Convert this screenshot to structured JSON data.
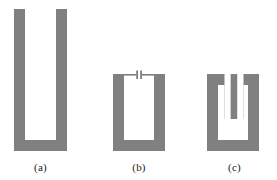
{
  "figure": {
    "background_color": "#ffffff",
    "shape_color": "#808080",
    "caption_color": "#1a1a1a",
    "panel_count": 3
  },
  "panels": [
    {
      "id": "a",
      "caption": "(a)",
      "name": "open-u-resonator-tall",
      "description": "tall open U-shaped split ring with long parallel arms",
      "geometry": {
        "x": 14,
        "y": 9,
        "width": 53,
        "height": 142,
        "stroke_width": 11,
        "gap_top": true
      }
    },
    {
      "id": "b",
      "caption": "(b)",
      "name": "u-resonator-with-capacitive-gap",
      "description": "U-shaped split ring closed at top by a thin bar with a central capacitive gap",
      "geometry": {
        "x": 113,
        "y": 74,
        "width": 52,
        "height": 77,
        "stroke_width": 11,
        "top_bar_thickness": 2,
        "gap_width": 3,
        "gap_marks": 2
      }
    },
    {
      "id": "c",
      "caption": "(c)",
      "name": "u-resonator-with-inner-tongue",
      "description": "U-shaped split ring with a narrow vertical slit cut from the top forming an inner tongue",
      "geometry": {
        "x": 207,
        "y": 74,
        "width": 52,
        "height": 77,
        "stroke_width": 11,
        "slit_width": 4,
        "tongue_width": 7,
        "tongue_depth": 44
      }
    }
  ],
  "captions": {
    "a": "(a)",
    "b": "(b)",
    "c": "(c)",
    "row_y": 161
  }
}
